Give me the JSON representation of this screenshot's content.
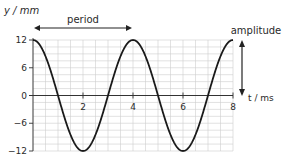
{
  "chart_data": {
    "type": "line",
    "title": "",
    "xlabel": "t / ms",
    "ylabel": "y / mm",
    "xlim": [
      0,
      8
    ],
    "ylim": [
      -12,
      12
    ],
    "x_ticks": [
      2,
      4,
      6,
      8
    ],
    "x_tick_labels": [
      "2",
      "4",
      "6",
      "8"
    ],
    "y_ticks": [
      12,
      6,
      0,
      -6,
      -12
    ],
    "y_tick_labels": [
      "12",
      "6",
      "0",
      "−6",
      "−12"
    ],
    "grid": true,
    "legend": null,
    "series": [
      {
        "name": "displacement",
        "function": "y = 12 cos(2π t / 4)",
        "amplitude": 12,
        "period": 4,
        "x": [
          0,
          1,
          2,
          3,
          4,
          5,
          6,
          7,
          8
        ],
        "y": [
          12,
          0,
          -12,
          0,
          12,
          0,
          -12,
          0,
          12
        ]
      }
    ],
    "annotations": [
      {
        "text": "period",
        "type": "double-arrow",
        "from_t": 0,
        "to_t": 4
      },
      {
        "text": "amplitude",
        "type": "double-arrow",
        "from_y": 12,
        "to_y": 0
      }
    ]
  },
  "labels": {
    "y_axis": "y / mm",
    "x_axis": "t / ms",
    "period": "period",
    "amplitude": "amplitude",
    "ytick_12": "12",
    "ytick_6": "6",
    "ytick_0": "0",
    "ytick_m6": "−6",
    "ytick_m12": "−12",
    "xtick_2": "2",
    "xtick_4": "4",
    "xtick_6": "6",
    "xtick_8": "8"
  },
  "colors": {
    "curve": "#1a1a1a",
    "grid": "#cfcfcf",
    "axis": "#333333",
    "text": "#2a2a2a"
  }
}
